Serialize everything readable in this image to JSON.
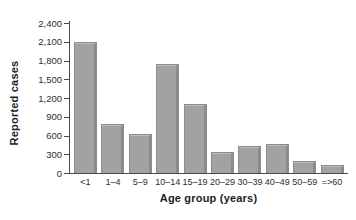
{
  "chart_data": {
    "type": "bar",
    "title": "",
    "xlabel": "Age group (years)",
    "ylabel": "Reported cases",
    "categories": [
      "<1",
      "1–4",
      "5–9",
      "10–14",
      "15–19",
      "20–29",
      "30–39",
      "40–49",
      "50–59",
      "=>60"
    ],
    "values": [
      2100,
      780,
      620,
      1750,
      1100,
      330,
      430,
      470,
      190,
      130
    ],
    "ylim": [
      0,
      2400
    ],
    "ytick_step": 300,
    "ytick_labels": [
      "0",
      "300",
      "600",
      "900",
      "1,200",
      "1,500",
      "1,800",
      "2,100",
      "2,400"
    ],
    "grid": false,
    "legend": null,
    "colors": {
      "bar_fill": "#a2a2a2",
      "bar_border": "#8c8c8c",
      "axis": "#4a4a4a",
      "text": "#2e2e2e"
    }
  }
}
